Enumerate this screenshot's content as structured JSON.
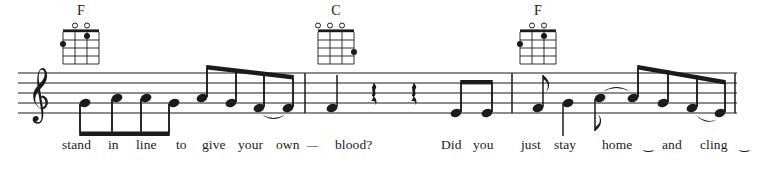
{
  "score": {
    "type": "lead-sheet",
    "clef": "treble",
    "instrument_chords": "ukulele",
    "ink_color": "#1b1b1b",
    "background_color": "#ffffff",
    "staff": {
      "line_count": 5,
      "top_y": 73,
      "line_spacing": 10,
      "left_x": 18,
      "right_x": 737
    },
    "barlines": [
      {
        "name": "barline-1",
        "x": 305
      },
      {
        "name": "barline-2",
        "x": 512
      },
      {
        "name": "barline-end",
        "x": 735
      }
    ],
    "chord_diagrams": [
      {
        "name": "F",
        "x": 60,
        "y": 22,
        "strings": 4,
        "frets": 4,
        "open_strings": [
          2,
          3
        ],
        "muted_strings": [],
        "dots": [
          {
            "string": 1,
            "fret": 2
          },
          {
            "string": 3,
            "fret": 1
          }
        ]
      },
      {
        "name": "C",
        "x": 315,
        "y": 22,
        "strings": 4,
        "frets": 4,
        "open_strings": [
          1,
          2,
          3
        ],
        "muted_strings": [],
        "dots": [
          {
            "string": 4,
            "fret": 3
          }
        ]
      },
      {
        "name": "F",
        "x": 517,
        "y": 22,
        "strings": 4,
        "frets": 4,
        "open_strings": [
          2,
          3
        ],
        "muted_strings": [],
        "dots": [
          {
            "string": 1,
            "fret": 2
          },
          {
            "string": 3,
            "fret": 1
          }
        ]
      }
    ],
    "notes": [
      {
        "id": "n1",
        "x": 85,
        "y": 103,
        "stem": "down",
        "beam_group": 1,
        "duration": "eighth"
      },
      {
        "id": "n2",
        "x": 117,
        "y": 98,
        "stem": "down",
        "beam_group": 1,
        "duration": "eighth"
      },
      {
        "id": "n3",
        "x": 146,
        "y": 98,
        "stem": "down",
        "beam_group": 1,
        "duration": "eighth"
      },
      {
        "id": "n4",
        "x": 174,
        "y": 103,
        "stem": "down",
        "beam_group": 1,
        "duration": "eighth"
      },
      {
        "id": "n5",
        "x": 202,
        "y": 98,
        "stem": "up",
        "beam_group": 2,
        "duration": "eighth"
      },
      {
        "id": "n6",
        "x": 231,
        "y": 103,
        "stem": "up",
        "beam_group": 2,
        "duration": "eighth"
      },
      {
        "id": "n7",
        "x": 259,
        "y": 108,
        "stem": "up",
        "beam_group": 2,
        "duration": "eighth"
      },
      {
        "id": "n8",
        "x": 288,
        "y": 108,
        "stem": "up",
        "beam_group": 2,
        "duration": "eighth"
      },
      {
        "id": "n9",
        "x": 332,
        "y": 108,
        "stem": "up",
        "beam_group": 0,
        "duration": "quarter"
      },
      {
        "id": "n10",
        "x": 456,
        "y": 113,
        "stem": "up",
        "beam_group": 3,
        "duration": "eighth"
      },
      {
        "id": "n11",
        "x": 487,
        "y": 113,
        "stem": "up",
        "beam_group": 3,
        "duration": "eighth"
      },
      {
        "id": "n12",
        "x": 538,
        "y": 108,
        "stem": "up",
        "beam_group": 0,
        "duration": "eighth-flag"
      },
      {
        "id": "n13",
        "x": 568,
        "y": 103,
        "stem": "down",
        "beam_group": 0,
        "duration": "quarter"
      },
      {
        "id": "n14",
        "x": 600,
        "y": 98,
        "stem": "down",
        "beam_group": 0,
        "duration": "eighth-flag-down"
      },
      {
        "id": "n15",
        "x": 633,
        "y": 98,
        "stem": "up",
        "beam_group": 4,
        "duration": "eighth"
      },
      {
        "id": "n16",
        "x": 663,
        "y": 103,
        "stem": "up",
        "beam_group": 4,
        "duration": "eighth"
      },
      {
        "id": "n17",
        "x": 692,
        "y": 108,
        "stem": "up",
        "beam_group": 4,
        "duration": "eighth"
      },
      {
        "id": "n18",
        "x": 720,
        "y": 113,
        "stem": "up",
        "beam_group": 4,
        "duration": "eighth"
      }
    ],
    "rests": [
      {
        "id": "r1",
        "x": 372,
        "y": 93,
        "duration": "quarter"
      },
      {
        "id": "r2",
        "x": 412,
        "y": 93,
        "duration": "quarter"
      }
    ],
    "ties": [
      {
        "from": "n7",
        "to": "n8",
        "direction": "below"
      },
      {
        "from": "n14",
        "to": "n15",
        "direction": "above"
      },
      {
        "from": "n17",
        "to": "n18",
        "direction": "below"
      }
    ],
    "lyrics": [
      {
        "text": "stand",
        "x": 62
      },
      {
        "text": "in",
        "x": 108
      },
      {
        "text": "line",
        "x": 136
      },
      {
        "text": "to",
        "x": 176
      },
      {
        "text": "give",
        "x": 202
      },
      {
        "text": "your",
        "x": 238
      },
      {
        "text": "own",
        "x": 276
      },
      {
        "text": "—",
        "x": 307
      },
      {
        "text": "blood?",
        "x": 335
      },
      {
        "text": "Did",
        "x": 441
      },
      {
        "text": "you",
        "x": 473
      },
      {
        "text": "just",
        "x": 521
      },
      {
        "text": "stay",
        "x": 554
      },
      {
        "text": "home",
        "x": 602
      },
      {
        "text": "‿",
        "x": 644
      },
      {
        "text": "and",
        "x": 662
      },
      {
        "text": "cling",
        "x": 700
      },
      {
        "text": "‿",
        "x": 740
      }
    ],
    "lyrics_baseline_y": 149,
    "lyrics_line_full": "stand in line to give your own — blood?  Did you  just stay  home ‿ and cling ‿"
  }
}
